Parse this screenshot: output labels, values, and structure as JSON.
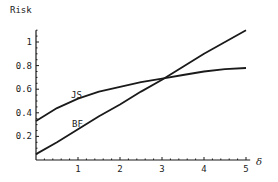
{
  "chart_data": {
    "type": "line",
    "title": "",
    "xlabel": "δ",
    "ylabel": "Risk",
    "xlim": [
      0,
      5.1
    ],
    "ylim": [
      0,
      1.1
    ],
    "x_ticks": [
      "1",
      "2",
      "3",
      "4",
      "5"
    ],
    "y_ticks": [
      "0.2",
      "0.4",
      "0.6",
      "0.8",
      "1"
    ],
    "grid": false,
    "legend": "inline labels",
    "x": [
      0,
      0.5,
      1,
      1.5,
      2,
      2.5,
      3,
      3.5,
      4,
      4.5,
      5
    ],
    "series": [
      {
        "name": "JS",
        "values": [
          0.33,
          0.44,
          0.52,
          0.58,
          0.62,
          0.66,
          0.69,
          0.72,
          0.75,
          0.77,
          0.78
        ]
      },
      {
        "name": "BF",
        "values": [
          0.05,
          0.15,
          0.26,
          0.37,
          0.47,
          0.58,
          0.68,
          0.79,
          0.9,
          1.0,
          1.1
        ]
      }
    ]
  },
  "labels": {
    "y_title": "Risk",
    "x_title": "δ",
    "js": "JS",
    "bf": "BF"
  },
  "colors": {
    "line": "#1a1a1a",
    "axis": "#1a1a1a"
  }
}
